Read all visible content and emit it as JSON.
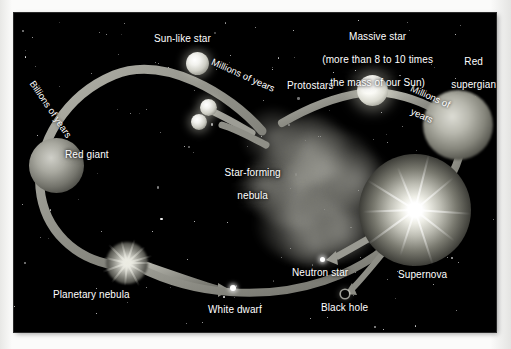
{
  "figure": {
    "background_color": "#000000",
    "paper_color": "#f6f6f4",
    "label_color": "#ffffff",
    "track_color": "#9a9a92"
  },
  "labels": {
    "sun_like_star": "Sun-like star",
    "billions_of_years": "Billions of years",
    "millions_of_years_left": "Millions of years",
    "millions_of_years_right": "Millions of\nyears",
    "red_giant": "Red giant",
    "planetary_nebula": "Planetary nebula",
    "white_dwarf": "White dwarf",
    "star_forming_nebula": "Star-forming\nnebula",
    "star_forming_nebula_line1": "Star-forming",
    "star_forming_nebula_line2": "nebula",
    "protostars": "Protostars",
    "massive_star_line1": "Massive star",
    "massive_star_line2": "(more than 8 to 10 times",
    "massive_star_line3": "the mass of our Sun)",
    "red_supergiant_line1": "Red",
    "red_supergiant_line2": "supergiant",
    "neutron_star": "Neutron star",
    "black_hole": "Black hole",
    "supernova": "Supernova",
    "millions_of_years_right_line1": "Millions of",
    "millions_of_years_right_line2": "years"
  },
  "objects": [
    {
      "name": "star-forming-nebula",
      "type": "nebula",
      "x": 300,
      "y": 175
    },
    {
      "name": "protostar-upper",
      "type": "protostar",
      "x": 195,
      "y": 95
    },
    {
      "name": "protostar-lower",
      "type": "protostar",
      "x": 186,
      "y": 110
    },
    {
      "name": "sun-like-star",
      "type": "star",
      "x": 183,
      "y": 50
    },
    {
      "name": "red-giant",
      "type": "star",
      "x": 42,
      "y": 152
    },
    {
      "name": "planetary-nebula",
      "type": "nebula",
      "x": 113,
      "y": 250
    },
    {
      "name": "white-dwarf",
      "type": "remnant",
      "x": 219,
      "y": 275
    },
    {
      "name": "massive-star",
      "type": "star",
      "x": 358,
      "y": 77
    },
    {
      "name": "red-supergiant",
      "type": "star",
      "x": 444,
      "y": 112
    },
    {
      "name": "supernova",
      "type": "explosion",
      "x": 401,
      "y": 197
    },
    {
      "name": "neutron-star",
      "type": "remnant",
      "x": 309,
      "y": 247
    },
    {
      "name": "black-hole",
      "type": "remnant",
      "x": 331,
      "y": 281
    }
  ],
  "stages": {
    "low_mass_track": [
      "Star-forming nebula",
      "Protostars",
      "Sun-like star",
      "Red giant",
      "Planetary nebula",
      "White dwarf"
    ],
    "high_mass_track": [
      "Star-forming nebula",
      "Protostars",
      "Massive star",
      "Red supergiant",
      "Supernova",
      "Neutron star",
      "Black hole"
    ]
  }
}
